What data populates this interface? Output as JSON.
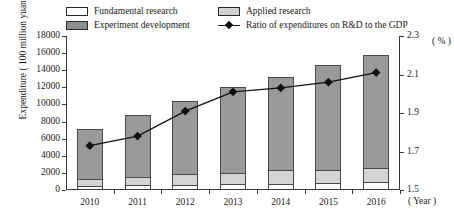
{
  "chart_data": {
    "type": "bar",
    "title": "",
    "categories": [
      "2010",
      "2011",
      "2012",
      "2013",
      "2014",
      "2015",
      "2016"
    ],
    "xlabel": "( Year )",
    "ylabel": "Expenditure ( 100 million yuan )",
    "ylabel_right": "( % )",
    "ylim": [
      0,
      18000
    ],
    "ylim_right": [
      1.5,
      2.3
    ],
    "yticks": [
      "0",
      "2000",
      "4000",
      "6000",
      "8000",
      "10000",
      "12000",
      "14000",
      "16000",
      "18000"
    ],
    "yticks_right": [
      "1.5",
      "1.7",
      "1.9",
      "2.1",
      "2.3"
    ],
    "grid": false,
    "legend_position": "top",
    "stacked": true,
    "series": [
      {
        "name": "Fundamental research",
        "kind": "bar",
        "color": "#ffffff",
        "values": [
          325,
          411,
          499,
          555,
          626,
          716,
          823
        ]
      },
      {
        "name": "Applied research",
        "kind": "bar",
        "color": "#d4d4d4",
        "values": [
          894,
          1029,
          1270,
          1360,
          1570,
          1528,
          1611
        ]
      },
      {
        "name": "Experiment development",
        "kind": "bar",
        "color": "#9a9a9a",
        "values": [
          5843,
          7246,
          8532,
          9996,
          10907,
          12228,
          13247
        ]
      },
      {
        "name": "Ratio of expenditures on R&D to the GDP",
        "kind": "line",
        "axis": "right",
        "color": "#111111",
        "values": [
          1.73,
          1.78,
          1.91,
          2.01,
          2.03,
          2.06,
          2.11
        ]
      }
    ]
  },
  "legend": {
    "items": [
      {
        "label": "Fundamental research",
        "swatch": "fundamental"
      },
      {
        "label": "Experiment development",
        "swatch": "experiment"
      },
      {
        "label": "Applied research",
        "swatch": "applied"
      },
      {
        "label": "Ratio of expenditures on R&D to the GDP",
        "swatch": "line"
      }
    ]
  }
}
